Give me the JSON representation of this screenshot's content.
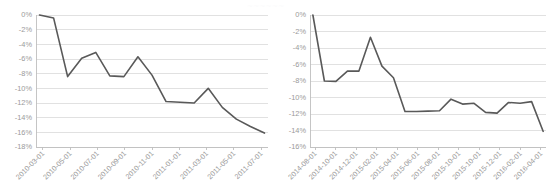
{
  "figure": {
    "background_color": "#ffffff",
    "line_color": "#595959",
    "grid_color": "#d9d9d9",
    "axis_color": "#bfbfbf",
    "label_color": "#9a9a9a",
    "faint_top_text": "~~~~~~"
  },
  "chart_data": [
    {
      "id": "left",
      "type": "line",
      "title": "",
      "xlabel": "",
      "ylabel": "",
      "grid": true,
      "legend": "none",
      "ylim": [
        -18,
        0
      ],
      "yticks": [
        0,
        -2,
        -4,
        -6,
        -8,
        -10,
        -12,
        -14,
        -16,
        -18
      ],
      "ytick_labels": [
        "0%",
        "-2%",
        "-4%",
        "-6%",
        "-8%",
        "-10%",
        "-12%",
        "-14%",
        "-16%",
        "-18%"
      ],
      "xtick_labels": [
        "2010-03-01",
        "2010-05-01",
        "2010-07-01",
        "2010-09-01",
        "2010-11-01",
        "2011-01-01",
        "2011-03-01",
        "2011-05-01",
        "2011-07-01"
      ],
      "x": [
        "2010-03-01",
        "2010-04-01",
        "2010-05-01",
        "2010-06-01",
        "2010-07-01",
        "2010-08-01",
        "2010-09-01",
        "2010-10-01",
        "2010-11-01",
        "2010-12-01",
        "2011-01-01",
        "2011-02-01",
        "2011-03-01",
        "2011-04-01",
        "2011-05-01",
        "2011-06-01",
        "2011-07-01"
      ],
      "values": [
        0.0,
        -0.4,
        -8.4,
        -5.9,
        -5.1,
        -8.3,
        -8.4,
        -5.7,
        -8.2,
        -11.8,
        -11.9,
        -12.0,
        -10.0,
        -12.6,
        -14.2,
        -15.2,
        -16.1
      ]
    },
    {
      "id": "right",
      "type": "line",
      "title": "",
      "xlabel": "",
      "ylabel": "",
      "grid": true,
      "legend": "none",
      "ylim": [
        -16,
        0
      ],
      "yticks": [
        0,
        -2,
        -4,
        -6,
        -8,
        -10,
        -12,
        -14,
        -16
      ],
      "ytick_labels": [
        "0%",
        "-2%",
        "-4%",
        "-6%",
        "-8%",
        "-10%",
        "-12%",
        "-14%",
        "-16%"
      ],
      "xtick_labels": [
        "2014-08-01",
        "2014-10-01",
        "2014-12-01",
        "2015-02-01",
        "2015-04-01",
        "2015-06-01",
        "2015-08-01",
        "2015-10-01",
        "2015-10-01",
        "2015-12-01",
        "2016-02-01",
        "2016-04-01"
      ],
      "x": [
        "2014-08-01",
        "2014-09-01",
        "2014-10-01",
        "2014-11-01",
        "2014-12-01",
        "2015-01-01",
        "2015-02-01",
        "2015-03-01",
        "2015-04-01",
        "2015-05-01",
        "2015-06-01",
        "2015-07-01",
        "2015-08-01",
        "2015-09-01",
        "2015-10-01",
        "2015-11-01",
        "2015-12-01",
        "2016-01-01",
        "2016-02-01",
        "2016-03-01",
        "2016-04-01"
      ],
      "values": [
        0.0,
        -8.0,
        -8.05,
        -6.8,
        -6.8,
        -2.7,
        -6.2,
        -7.6,
        -11.7,
        -11.7,
        -11.65,
        -11.6,
        -10.2,
        -10.8,
        -10.7,
        -11.8,
        -11.9,
        -10.6,
        -10.7,
        -10.5,
        -14.1
      ]
    }
  ]
}
